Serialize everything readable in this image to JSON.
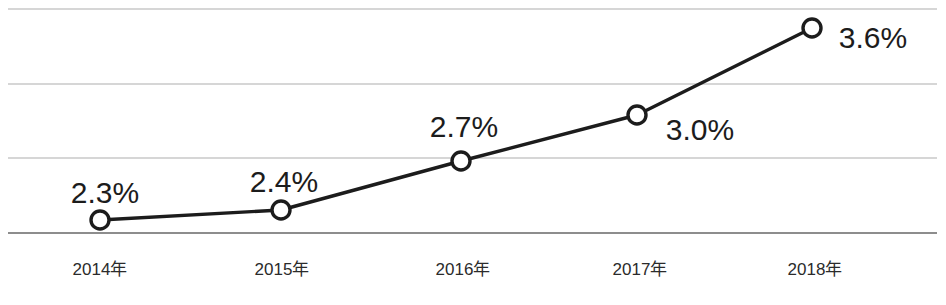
{
  "chart_data": {
    "type": "line",
    "title": "",
    "subtitle": "",
    "xlabel": "",
    "ylabel": "",
    "categories": [
      "2014年",
      "2015年",
      "2016年",
      "2017年",
      "2018年"
    ],
    "values": [
      2.3,
      2.4,
      2.7,
      3.0,
      3.6
    ],
    "point_labels": [
      "2.3%",
      "2.4%",
      "2.7%",
      "3.0%",
      "3.6%"
    ],
    "unit": "%",
    "ylim": [
      2.2,
      3.7
    ],
    "grid": true,
    "gridlines_y": [
      3.65,
      3.2,
      2.7,
      2.25
    ],
    "legend": "none",
    "marker_style": "open-circle",
    "colors": {
      "line": "#1c1c1c",
      "marker_fill": "#ffffff",
      "marker_stroke": "#1c1c1c",
      "gridline": "#c9c9c9",
      "axisline": "#8d8d8d",
      "label_text": "#1c1c1c",
      "tick_text": "#2b2b2b",
      "background": "#ffffff"
    },
    "points_px": [
      {
        "x": 100,
        "y": 220,
        "label_x": 105,
        "label_y": 203
      },
      {
        "x": 281,
        "y": 210,
        "label_x": 284,
        "label_y": 192
      },
      {
        "x": 461,
        "y": 161,
        "label_x": 464,
        "label_y": 137
      },
      {
        "x": 637,
        "y": 115,
        "label_x": 700,
        "label_y": 140
      },
      {
        "x": 812,
        "y": 28,
        "label_x": 873,
        "label_y": 48
      }
    ],
    "tick_px": [
      {
        "x": 100,
        "y": 275
      },
      {
        "x": 282,
        "y": 275
      },
      {
        "x": 463,
        "y": 275
      },
      {
        "x": 640,
        "y": 275
      },
      {
        "x": 815,
        "y": 275
      }
    ],
    "gridlines_px": [
      9,
      84,
      158,
      233
    ],
    "plot_left_px": 8,
    "plot_right_px": 937
  }
}
